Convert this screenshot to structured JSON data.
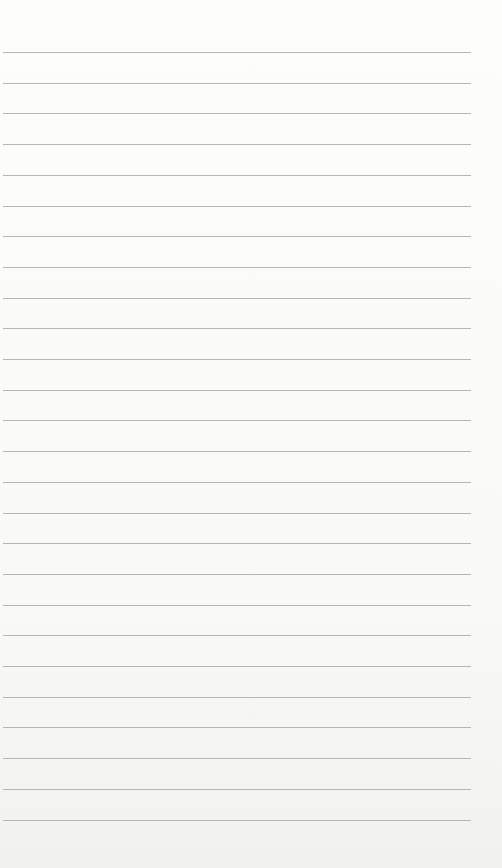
{
  "paper": {
    "kind": "ruled-notebook-sheet",
    "line_color": "#a9a9a9",
    "background_color": "#fbfbfa",
    "first_line_y": 52,
    "line_spacing": 30.7,
    "line_count": 26,
    "line_left": 3,
    "line_width": 468
  }
}
